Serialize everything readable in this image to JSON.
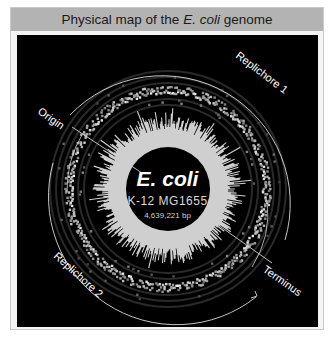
{
  "figure": {
    "title_prefix": "Physical map of the ",
    "title_italic": "E. coli",
    "title_suffix": " genome"
  },
  "genome": {
    "organism": "E. coli",
    "strain": "K-12  MG1655",
    "size": "4,639,221 bp"
  },
  "labels": {
    "origin": "Origin",
    "terminus": "Terminus",
    "replichore1": "Replichore 1",
    "replichore2": "Replichore 2"
  },
  "colors": {
    "background": "#000000",
    "title_bar": "#b3b3b3",
    "ring": "#e6e6e6",
    "starburst": "#cfcfcf",
    "text": "#ffffff"
  }
}
